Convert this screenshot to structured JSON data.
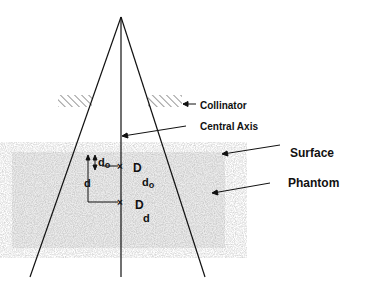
{
  "labels": {
    "collimator": "Collinator",
    "central_axis": "Central Axis",
    "surface": "Surface",
    "phantom": "Phantom",
    "d0_main": "d",
    "d0_sub": "o",
    "d_main": "d",
    "D_d0_main": "D",
    "D_d0_sub_main": "d",
    "D_d0_sub_sub": "o",
    "D_d_main": "D",
    "D_d_sub": "d",
    "mark": "×"
  },
  "colors": {
    "line": "#111111",
    "phantom": "#d9d9d9",
    "background": "#ffffff"
  }
}
